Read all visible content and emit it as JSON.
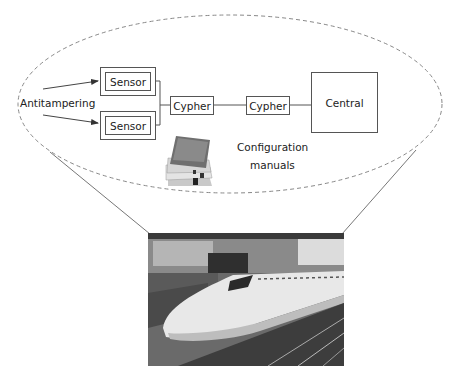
{
  "diagram": {
    "labels": {
      "antitampering": "Antitampering",
      "sensor_1": "Sensor",
      "sensor_2": "Sensor",
      "cypher_1": "Cypher",
      "cypher_2": "Cypher",
      "central": "Central",
      "config_line1": "Configuration",
      "config_line2": "manuals"
    },
    "nodes": [
      {
        "id": "sensor_1",
        "label": "Sensor",
        "type": "double-box"
      },
      {
        "id": "sensor_2",
        "label": "Sensor",
        "type": "double-box"
      },
      {
        "id": "cypher_1",
        "label": "Cypher",
        "type": "box"
      },
      {
        "id": "cypher_2",
        "label": "Cypher",
        "type": "box"
      },
      {
        "id": "central",
        "label": "Central",
        "type": "box"
      },
      {
        "id": "manuals",
        "label": "Configuration manuals",
        "type": "image"
      }
    ],
    "edges": [
      {
        "from": "antitampering",
        "to": "sensor_1",
        "arrow": true
      },
      {
        "from": "antitampering",
        "to": "sensor_2",
        "arrow": true
      },
      {
        "from": "sensor_1",
        "to": "cypher_1"
      },
      {
        "from": "sensor_2",
        "to": "cypher_1"
      },
      {
        "from": "cypher_1",
        "to": "cypher_2"
      },
      {
        "from": "cypher_2",
        "to": "central"
      }
    ],
    "callout": {
      "shape": "dashed-ellipse",
      "points_to": "train-photo"
    },
    "colors": {
      "line": "#555555",
      "dash": "#888888",
      "text": "#222222"
    }
  }
}
